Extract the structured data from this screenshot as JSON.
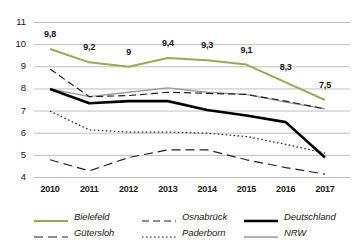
{
  "chart_data": {
    "type": "line",
    "title": "",
    "subtitle": "",
    "xlabel": "",
    "ylabel": "",
    "categories": [
      "2010",
      "2011",
      "2012",
      "2013",
      "2014",
      "2015",
      "2016",
      "2017"
    ],
    "x": [
      2010,
      2011,
      2012,
      2013,
      2014,
      2015,
      2016,
      2017
    ],
    "ylim": [
      3.6,
      11.4
    ],
    "yticks": [
      4,
      5,
      6,
      7,
      8,
      9,
      10,
      11
    ],
    "ytick_labels": [
      "4",
      "5",
      "6",
      "7",
      "8",
      "9",
      "10",
      "11"
    ],
    "grid": "horizontal",
    "legend_position": "bottom",
    "series": [
      {
        "name": "Bielefeld",
        "color": "#93ad55",
        "style": "solid",
        "width": 2.0,
        "values": [
          9.8,
          9.2,
          9.0,
          9.4,
          9.3,
          9.1,
          8.3,
          7.5
        ],
        "labels": [
          "9,8",
          "9,2",
          "9",
          "9,4",
          "9,3",
          "9,1",
          "8,3",
          "7,5"
        ]
      },
      {
        "name": "Osnabrück",
        "color": "#222222",
        "style": "dashed",
        "width": 1.2,
        "values": [
          8.9,
          7.65,
          7.7,
          7.85,
          7.8,
          7.75,
          7.45,
          7.1
        ]
      },
      {
        "name": "Deutschland",
        "color": "#000000",
        "style": "solid",
        "width": 2.6,
        "values": [
          8.0,
          7.35,
          7.45,
          7.45,
          7.05,
          6.8,
          6.5,
          4.9
        ]
      },
      {
        "name": "Gütersloh",
        "color": "#222222",
        "style": "longdash",
        "width": 1.2,
        "values": [
          4.8,
          4.3,
          4.9,
          5.25,
          5.25,
          4.8,
          4.45,
          4.15
        ]
      },
      {
        "name": "Paderborn",
        "color": "#222222",
        "style": "dotted",
        "width": 1.2,
        "values": [
          7.0,
          6.15,
          6.05,
          6.05,
          6.0,
          5.85,
          5.5,
          5.1
        ]
      },
      {
        "name": "NRW",
        "color": "#9a9a9a",
        "style": "solid",
        "width": 1.3,
        "values": [
          8.0,
          7.65,
          7.85,
          8.05,
          7.85,
          7.75,
          7.4,
          7.1
        ]
      }
    ],
    "value_labels": {
      "series": "Bielefeld",
      "values": [
        "9,8",
        "9,2",
        "9",
        "9,4",
        "9,3",
        "9,1",
        "8,3",
        "7,5"
      ]
    },
    "colors": {
      "bielefeld": "#93ad55",
      "deutschland": "#000000",
      "nrw": "#9a9a9a",
      "grid": "#b8b8b8",
      "text": "#1a1a1a",
      "background": "#ffffff"
    }
  },
  "legend": {
    "rows": [
      [
        {
          "label": "Bielefeld",
          "key": "bielefeld"
        },
        {
          "label": "Osnabrück",
          "key": "osnabrueck"
        },
        {
          "label": "Deutschland",
          "key": "deutschland"
        }
      ],
      [
        {
          "label": "Gütersloh",
          "key": "guetersloh"
        },
        {
          "label": "Paderborn",
          "key": "paderborn"
        },
        {
          "label": "NRW",
          "key": "nrw"
        }
      ]
    ]
  }
}
